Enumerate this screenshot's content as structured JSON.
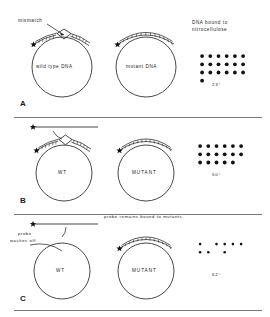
{
  "figure": {
    "ink_color": "#121212",
    "background": "#ffffff"
  },
  "panels": [
    {
      "letter": "A",
      "annotations": {
        "mismatch_label": "mismatch",
        "blot_title_line1": "DNA bound to",
        "blot_title_line2": "nitrocellulose"
      },
      "circles": [
        {
          "label": "wild type DNA",
          "has_mismatch_bubble": true,
          "probe_bound": true
        },
        {
          "label": "mutant DNA",
          "has_mismatch_bubble": false,
          "probe_bound": true
        }
      ],
      "blot": {
        "temperature": "23°",
        "intensity": "strong",
        "rows": [
          [
            1,
            1,
            1,
            1,
            1,
            1
          ],
          [
            1,
            1,
            1,
            1,
            1,
            1
          ],
          [
            1,
            1,
            1,
            1,
            1,
            1
          ],
          [
            1,
            0,
            0,
            0,
            0,
            0
          ]
        ]
      }
    },
    {
      "letter": "B",
      "annotations": {
        "probe_label": "",
        "blot_title_line1": "",
        "blot_title_line2": ""
      },
      "circles": [
        {
          "label": "WT",
          "has_mismatch_bubble": true,
          "probe_bound": true
        },
        {
          "label": "MUTANT",
          "has_mismatch_bubble": false,
          "probe_bound": true
        }
      ],
      "blot": {
        "temperature": "50°",
        "intensity": "strong",
        "rows": [
          [
            1,
            1,
            1,
            1,
            1,
            1
          ],
          [
            1,
            1,
            1,
            1,
            1,
            1
          ],
          [
            1,
            1,
            1,
            1,
            1,
            0
          ]
        ]
      }
    },
    {
      "letter": "C",
      "annotations": {
        "washoff_line1": "probe",
        "washoff_line2": "washes off",
        "remains_bound_label": "probe remains bound to mutants"
      },
      "circles": [
        {
          "label": "WT",
          "has_mismatch_bubble": false,
          "probe_bound": false
        },
        {
          "label": "MUTANT",
          "has_mismatch_bubble": false,
          "probe_bound": true
        }
      ],
      "blot": {
        "temperature": "62°",
        "intensity": "faint",
        "rows": [
          [
            1,
            0,
            1,
            1,
            1,
            1
          ],
          [
            1,
            1,
            0,
            1,
            0,
            0
          ],
          [
            0,
            0,
            0,
            0,
            0,
            0
          ]
        ]
      }
    }
  ]
}
